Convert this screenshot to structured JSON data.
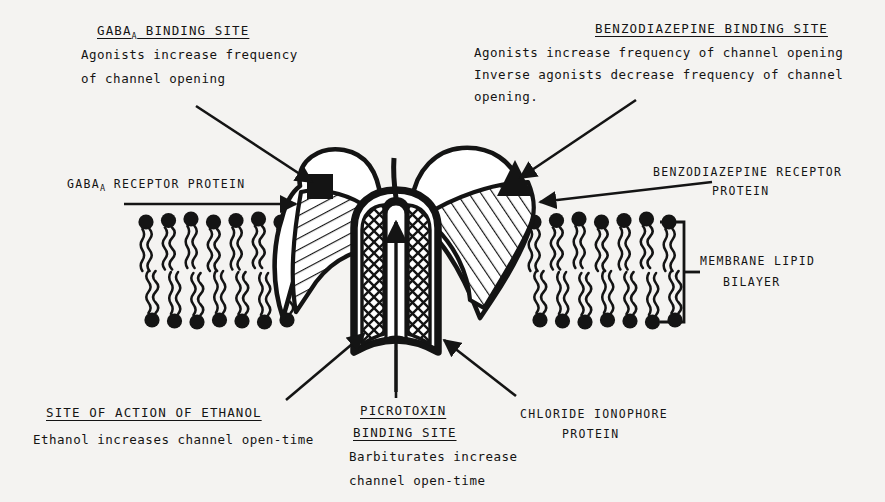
{
  "figure": {
    "background_color": "#f4f3f1",
    "ink_color": "#141414"
  },
  "annotations": {
    "gaba_binding_site": {
      "heading_main": "GABA",
      "heading_sub": "A",
      "heading_rest": " BINDING SITE",
      "line1": "Agonists increase frequency",
      "line2": "of channel opening"
    },
    "benzodiazepine_binding_site": {
      "heading": "BENZODIAZEPINE BINDING SITE",
      "line1": "Agonists increase frequency of channel opening",
      "line2": "Inverse agonists decrease frequency of channel",
      "line3": "opening."
    },
    "gaba_receptor_protein": {
      "label_main": "GABA",
      "label_sub": "A",
      "label_rest": " RECEPTOR PROTEIN"
    },
    "benzodiazepine_receptor_protein": {
      "line1": "BENZODIAZEPINE RECEPTOR",
      "line2": "PROTEIN"
    },
    "membrane_lipid_bilayer": {
      "line1": "MEMBRANE LIPID",
      "line2": "BILAYER"
    },
    "site_of_action_of_ethanol": {
      "heading": "SITE OF ACTION OF ETHANOL",
      "line1": "Ethanol increases channel open-time"
    },
    "picrotoxin_binding_site": {
      "heading_line1": "PICROTOXIN",
      "heading_line2": "BINDING SITE",
      "line1": "Barbiturates increase",
      "line2": "channel open-time"
    },
    "chloride_ionophore_protein": {
      "line1": "CHLORIDE IONOPHORE",
      "line2": "PROTEIN"
    }
  },
  "glyphs": {
    "gaba_site_marker": "filled-square",
    "benzodiazepine_site_marker": "filled-triangle",
    "channel_flux_arrow": "upward-arrow"
  }
}
